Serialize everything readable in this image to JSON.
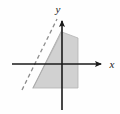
{
  "figure": {
    "type": "coordinate-plane-diagram",
    "width": 120,
    "height": 114,
    "background_color": "#fefefe"
  },
  "axes": {
    "x_axis": {
      "label": "x",
      "label_position": {
        "x": 112,
        "y": 68
      },
      "line": {
        "x1": 12,
        "y1": 64,
        "x2": 104,
        "y2": 64
      },
      "arrow_end": "right",
      "color": "#1a1a1a",
      "stroke_width": 1.6
    },
    "y_axis": {
      "label": "y",
      "label_position": {
        "x": 58,
        "y": 13
      },
      "line": {
        "x1": 62,
        "y1": 18,
        "x2": 62,
        "y2": 110
      },
      "arrow_end": "top",
      "color": "#1a1a1a",
      "stroke_width": 1.6
    },
    "origin": {
      "x": 62,
      "y": 64
    }
  },
  "dashed_line": {
    "name": "boundary-line-dashed",
    "x1": 22,
    "y1": 90,
    "x2": 57,
    "y2": 19,
    "color": "#8c8c8c",
    "stroke_width": 1.3,
    "dash_pattern": "4 3",
    "slope_description": "steep positive slope rising left to right"
  },
  "solid_boundary_line": {
    "name": "region-left-edge",
    "x1": 33,
    "y1": 88,
    "x2": 62,
    "y2": 30,
    "color": "#a8a8a8",
    "stroke_width": 1.0
  },
  "shaded_region": {
    "name": "solution-region",
    "fill_color": "#c9c9c9",
    "fill_opacity": 0.85,
    "stroke_color": "#b4b4b4",
    "polygon_points": "62,32 78,38 78,88 33,88",
    "description": "Shaded wedge bounded on the left by a steep line, on the right by a vertical edge, below by a horizontal edge"
  },
  "colors": {
    "ink": "#1a1a1a",
    "shade": "#c9c9c9",
    "dash": "#8c8c8c",
    "paper": "#fefefe"
  }
}
